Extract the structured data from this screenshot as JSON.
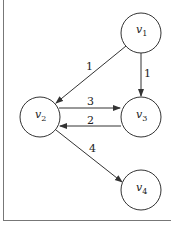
{
  "diagram": {
    "type": "directed-weighted-graph",
    "nodes": [
      {
        "id": "v1",
        "label": "v",
        "sub": "1",
        "cx": 141,
        "cy": 33
      },
      {
        "id": "v2",
        "label": "v",
        "sub": "2",
        "cx": 40,
        "cy": 117
      },
      {
        "id": "v3",
        "label": "v",
        "sub": "3",
        "cx": 141,
        "cy": 117
      },
      {
        "id": "v4",
        "label": "v",
        "sub": "4",
        "cx": 141,
        "cy": 190
      }
    ],
    "edges": [
      {
        "from": "v1",
        "to": "v2",
        "weight": "1"
      },
      {
        "from": "v1",
        "to": "v3",
        "weight": "1"
      },
      {
        "from": "v2",
        "to": "v3",
        "weight": "3"
      },
      {
        "from": "v3",
        "to": "v2",
        "weight": "2"
      },
      {
        "from": "v2",
        "to": "v4",
        "weight": "4"
      }
    ],
    "colors": {
      "stroke": "#333333",
      "background": "#ffffff"
    }
  }
}
